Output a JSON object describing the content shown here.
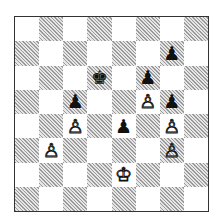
{
  "board": {
    "orientation": "white-bottom",
    "files": [
      "a",
      "b",
      "c",
      "d",
      "e",
      "f",
      "g",
      "h"
    ],
    "ranks": [
      8,
      7,
      6,
      5,
      4,
      3,
      2,
      1
    ],
    "colors": {
      "light": "#ffffff",
      "dark_hatch": "#9a9a9a"
    },
    "pieces": [
      {
        "square": "g7",
        "color": "black",
        "type": "pawn",
        "glyph": "♟"
      },
      {
        "square": "d6",
        "color": "black",
        "type": "king",
        "glyph": "♚"
      },
      {
        "square": "f6",
        "color": "black",
        "type": "pawn",
        "glyph": "♟"
      },
      {
        "square": "c5",
        "color": "black",
        "type": "pawn",
        "glyph": "♟"
      },
      {
        "square": "f5",
        "color": "white",
        "type": "pawn",
        "glyph": "♙"
      },
      {
        "square": "g5",
        "color": "black",
        "type": "pawn",
        "glyph": "♟"
      },
      {
        "square": "c4",
        "color": "white",
        "type": "pawn",
        "glyph": "♙"
      },
      {
        "square": "e4",
        "color": "black",
        "type": "pawn",
        "glyph": "♟"
      },
      {
        "square": "g4",
        "color": "white",
        "type": "pawn",
        "glyph": "♙"
      },
      {
        "square": "b3",
        "color": "white",
        "type": "pawn",
        "glyph": "♙"
      },
      {
        "square": "g3",
        "color": "white",
        "type": "pawn",
        "glyph": "♙"
      },
      {
        "square": "e2",
        "color": "white",
        "type": "king",
        "glyph": "♔"
      }
    ]
  }
}
